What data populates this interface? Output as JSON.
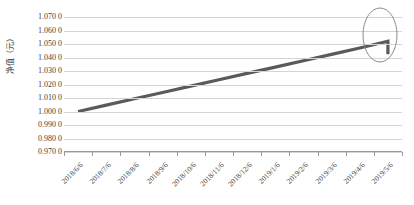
{
  "chart_data": {
    "type": "line",
    "title": "",
    "xlabel": "",
    "ylabel": "净值（元）",
    "ylim": [
      0.97,
      1.07
    ],
    "ytick_labels": [
      "1.070 0",
      "1.060 0",
      "1.050 0",
      "1.040 0",
      "1.030 0",
      "1.020 0",
      "1.010 0",
      "1.000 0",
      "0.990 0",
      "0.980 0",
      "0.970 0"
    ],
    "ytick_values": [
      1.07,
      1.06,
      1.05,
      1.04,
      1.03,
      1.02,
      1.01,
      1.0,
      0.99,
      0.98,
      0.97
    ],
    "categories": [
      "2018/6/6",
      "2018/7/6",
      "2018/8/6",
      "2018/9/6",
      "2018/10/6",
      "2018/11/6",
      "2018/12/6",
      "2019/1/6",
      "2019/2/6",
      "2019/3/6",
      "2019/4/6",
      "2019/5/6"
    ],
    "series": [
      {
        "name": "净值",
        "color": "#5a5a5a",
        "values": [
          1.0,
          1.0047,
          1.0094,
          1.0141,
          1.0188,
          1.0235,
          1.0282,
          1.0329,
          1.0376,
          1.0423,
          1.047,
          1.052
        ]
      }
    ],
    "final_drop": {
      "from": 1.052,
      "to": 1.0425
    },
    "annotations": [
      {
        "type": "ellipse",
        "name": "highlight-ellipse",
        "color": "#8c8c8c",
        "target": "2019/5/6"
      }
    ],
    "grid": true,
    "legend": false,
    "legend_position": "none"
  },
  "caption": {
    "text": ""
  }
}
